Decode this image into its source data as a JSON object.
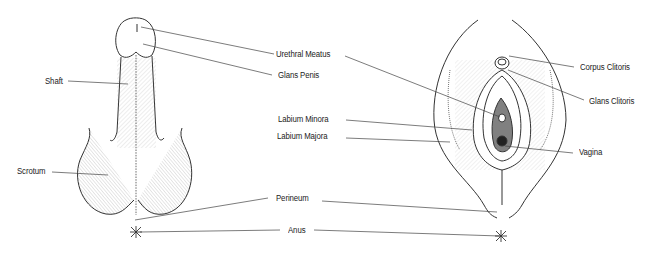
{
  "diagram": {
    "type": "anatomical-comparison",
    "colors": {
      "line": "#333333",
      "shade": "#777777",
      "dark": "#555555",
      "background": "#ffffff"
    },
    "left_figure": {
      "name": "male",
      "labels": {
        "shaft": "Shaft",
        "scrotum": "Scrotum"
      }
    },
    "right_figure": {
      "name": "female",
      "labels": {
        "corpus_clitoris": "Corpus Clitoris",
        "glans_clitoris": "Glans Clitoris",
        "vagina": "Vagina"
      }
    },
    "center_labels": {
      "urethral_meatus": "Urethral Meatus",
      "glans_penis": "Glans Penis",
      "labium_minora": "Labium Minora",
      "labium_majora": "Labium Majora",
      "perineum": "Perineum",
      "anus": "Anus"
    }
  }
}
